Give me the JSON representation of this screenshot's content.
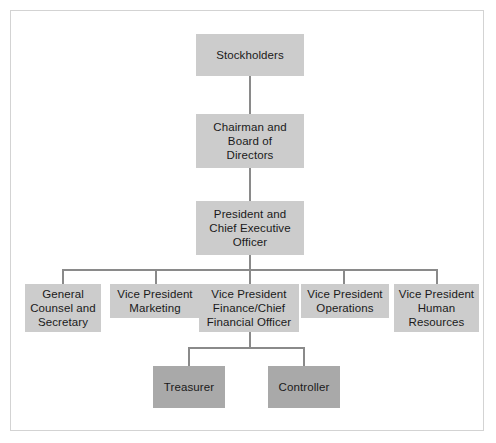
{
  "document": {
    "type": "organization-chart",
    "title": "Corporate Organization Chart"
  },
  "colors": {
    "node_fill_primary": "#cccccc",
    "node_fill_secondary": "#a9a9a9",
    "connector": "#8a8a8a",
    "border": "#d3d3d3",
    "text": "#1a1a1a",
    "background": "#ffffff"
  },
  "nodes": {
    "stockholders": {
      "label": "Stockholders",
      "level": 0
    },
    "board": {
      "label": "Chairman and\nBoard of\nDirectors",
      "level": 1
    },
    "ceo": {
      "label": "President and\nChief Executive\nOfficer",
      "level": 2
    },
    "general_counsel": {
      "label": "General\nCounsel and\nSecretary",
      "level": 3
    },
    "vp_marketing": {
      "label": "Vice President\nMarketing",
      "level": 3
    },
    "vp_finance": {
      "label": "Vice President\nFinance/Chief\nFinancial Officer",
      "level": 3
    },
    "vp_operations": {
      "label": "Vice President\nOperations",
      "level": 3
    },
    "vp_human_resources": {
      "label": "Vice President\nHuman\nResources",
      "level": 3
    },
    "treasurer": {
      "label": "Treasurer",
      "level": 4
    },
    "controller": {
      "label": "Controller",
      "level": 4
    }
  }
}
